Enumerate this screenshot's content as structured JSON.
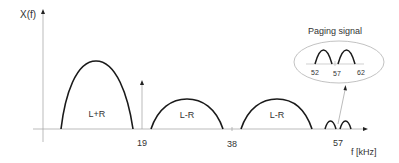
{
  "diagram": {
    "y_axis_label": "X(f)",
    "x_axis_label": "f [kHz]",
    "ticks": {
      "pilot": "19",
      "carrier": "38",
      "subcarrier": "57"
    },
    "bands": {
      "mono": "L+R",
      "stereo_lower": "L-R",
      "stereo_upper": "L-R"
    },
    "inset": {
      "title": "Paging signal",
      "ticks": [
        "52",
        "57",
        "62"
      ]
    },
    "colors": {
      "curve": "#1a1a1a",
      "axis": "#aaaaaa",
      "text": "#333333",
      "ellipse": "#bbbbbb"
    }
  }
}
